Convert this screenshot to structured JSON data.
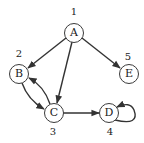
{
  "diagram": {
    "type": "directed-graph",
    "nodes": [
      {
        "id": "A",
        "label": "A",
        "number": "1",
        "cx": 74,
        "cy": 33
      },
      {
        "id": "B",
        "label": "B",
        "number": "2",
        "cx": 19,
        "cy": 74
      },
      {
        "id": "C",
        "label": "C",
        "number": "3",
        "cx": 54,
        "cy": 113
      },
      {
        "id": "D",
        "label": "D",
        "number": "4",
        "cx": 109,
        "cy": 113
      },
      {
        "id": "E",
        "label": "E",
        "number": "5",
        "cx": 129,
        "cy": 74
      }
    ],
    "edges": [
      {
        "from": "A",
        "to": "B"
      },
      {
        "from": "A",
        "to": "C"
      },
      {
        "from": "A",
        "to": "E"
      },
      {
        "from": "B",
        "to": "C"
      },
      {
        "from": "C",
        "to": "B"
      },
      {
        "from": "C",
        "to": "D"
      },
      {
        "from": "D",
        "to": "D"
      }
    ],
    "colors": {
      "stroke": "#333333",
      "fill": "#ffffff",
      "text": "#222222"
    }
  }
}
